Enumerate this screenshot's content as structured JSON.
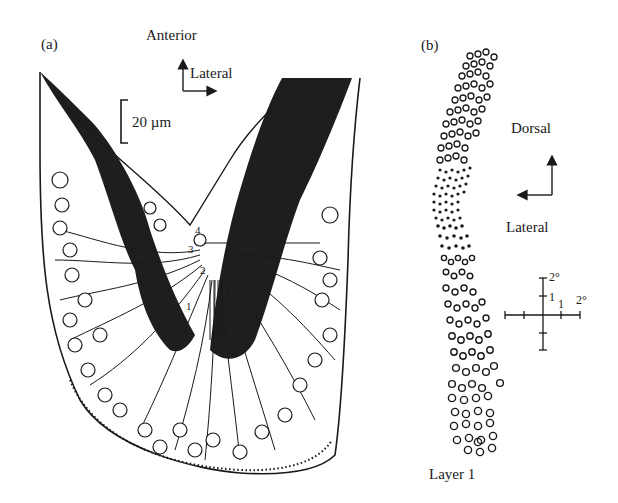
{
  "panel_a": {
    "label": "(a)",
    "orientation": {
      "up": "Anterior",
      "right": "Lateral"
    },
    "scale_bar": "20 µm",
    "layer_markers": [
      "1",
      "2",
      "3",
      "4"
    ],
    "colors": {
      "dark_region": "#1e1e1e",
      "outline": "#1a1a1a",
      "background": "#ffffff"
    }
  },
  "panel_b": {
    "label": "(b)",
    "orientation": {
      "up": "Dorsal",
      "left": "Lateral"
    },
    "degree_scale": {
      "top": "2°",
      "inner_vertical": "1",
      "inner_horizontal": "1",
      "right": "2°"
    },
    "caption": "Layer 1"
  }
}
